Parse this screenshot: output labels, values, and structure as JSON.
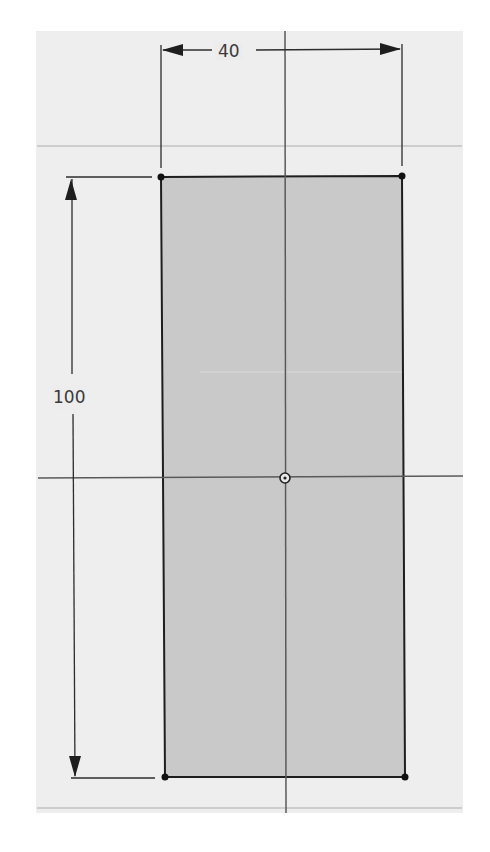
{
  "sketch": {
    "title": "Rectangle sketch",
    "rectangle": {
      "corners": {
        "top_left": [
          161,
          177
        ],
        "top_right": [
          402,
          176
        ],
        "bottom_left": [
          165,
          777
        ],
        "bottom_right": [
          405,
          777
        ]
      },
      "fill": "#c8c8c8",
      "stroke": "#1e1e1e"
    },
    "origin_point": {
      "x": 285,
      "y": 478,
      "label": "origin"
    },
    "axes": {
      "vertical_x": 285,
      "horizontal_y": 478,
      "color": "#5a5a5a"
    },
    "grid_lines": {
      "horizontal": [
        146,
        808
      ],
      "color": "#c4c4c4"
    },
    "canvas_background": "#eeeeee",
    "dimensions": {
      "width": {
        "value": "40",
        "label": "40"
      },
      "height": {
        "value": "100",
        "label": "100"
      }
    }
  }
}
